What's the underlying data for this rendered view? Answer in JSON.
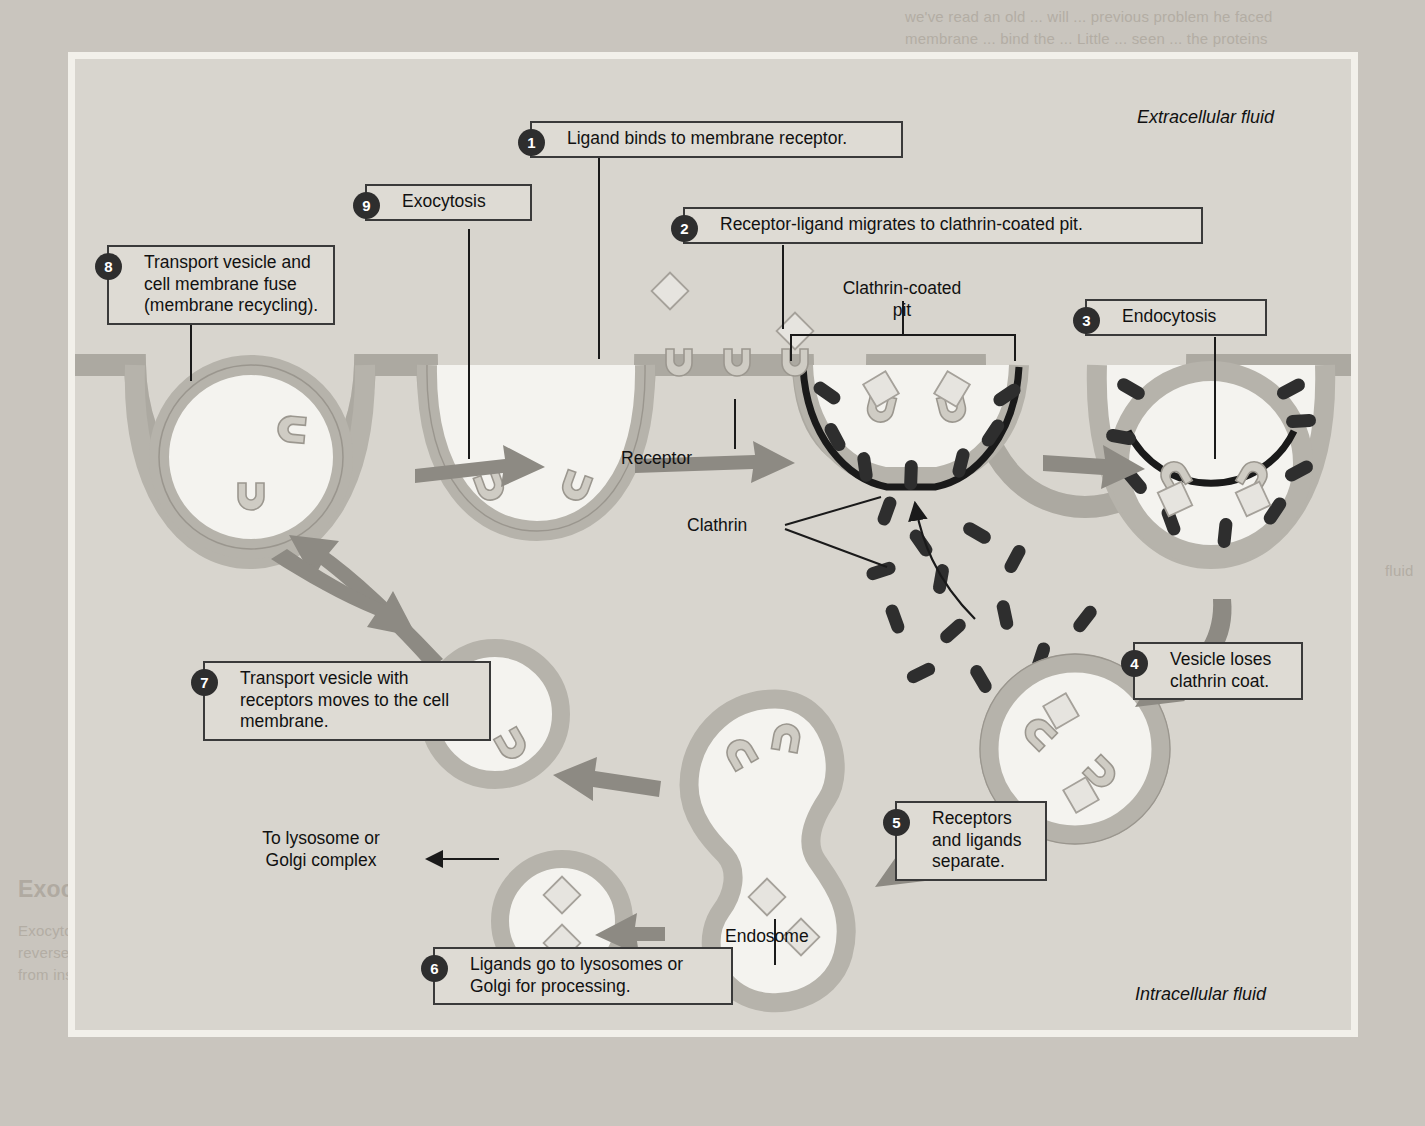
{
  "figure": {
    "region_labels": {
      "extracellular": "Extracellular fluid",
      "intracellular": "Intracellular fluid"
    },
    "steps": [
      {
        "num": "1",
        "text": "Ligand binds to membrane receptor."
      },
      {
        "num": "2",
        "text": "Receptor-ligand migrates to clathrin-coated pit."
      },
      {
        "num": "3",
        "text": "Endocytosis"
      },
      {
        "num": "4",
        "text": "Vesicle loses clathrin coat."
      },
      {
        "num": "5",
        "text": "Receptors and ligands separate."
      },
      {
        "num": "6",
        "text": "Ligands go to lysosomes or Golgi for processing."
      },
      {
        "num": "7",
        "text": "Transport vesicle with receptors moves to the cell membrane."
      },
      {
        "num": "8",
        "text": "Transport vesicle and cell membrane fuse (membrane recycling)."
      },
      {
        "num": "9",
        "text": "Exocytosis"
      }
    ],
    "structure_labels": {
      "clathrin_coated_pit": "Clathrin-coated\npit",
      "receptor": "Receptor",
      "clathrin": "Clathrin",
      "endosome": "Endosome",
      "to_lysosome": "To lysosome or\nGolgi complex"
    },
    "colors": {
      "figure_background": "#d8d5ce",
      "page_background": "#c9c5be",
      "membrane": "#b6b3ab",
      "vesicle_lumen": "#f4f3ef",
      "receptor_fill": "#cfccc4",
      "clathrin": "#2e2e2e",
      "arrow": "#8d8a83",
      "label_box": "#dedbd4",
      "outline": "#3a3a3a",
      "badge": "#2e2e2e"
    }
  },
  "page_bleed": {
    "top_right": "we've read an old ... will ... previous problem he faced\nmembrane ... bind the ... Little ... seen ... the proteins",
    "right_mid": "fluid",
    "bottom_heading": "Exocytosis Caters Specific",
    "bottom_text": "Exocytosis, the ... removal of the ... cell ... is the\nreverse of ... the func... of the ... the invagination ...\nfrom inside ... of the ... fuses with the cell membrane."
  }
}
